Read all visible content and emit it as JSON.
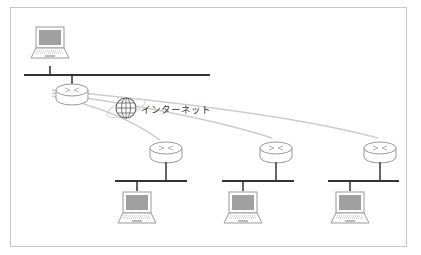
{
  "diagram": {
    "type": "network-topology",
    "cloud": {
      "label": "インターネット",
      "icon": "globe-icon"
    },
    "colors": {
      "frame": "#c8c8c8",
      "bus": "#333333",
      "device_outline": "#999999",
      "screen": "#a0a0a0",
      "wan_link": "#cccccc"
    },
    "nodes": [
      {
        "id": "lan-top",
        "router": "router-icon",
        "pc": "laptop-icon"
      },
      {
        "id": "lan-1",
        "router": "router-icon",
        "pc": "laptop-icon"
      },
      {
        "id": "lan-2",
        "router": "router-icon",
        "pc": "laptop-icon"
      },
      {
        "id": "lan-3",
        "router": "router-icon",
        "pc": "laptop-icon"
      }
    ]
  }
}
